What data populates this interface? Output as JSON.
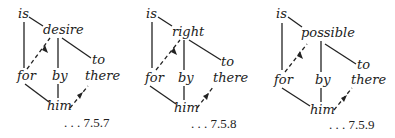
{
  "diagrams": [
    {
      "id": "7.5.7",
      "label": ". . . 7.5.7",
      "nodes": {
        "is": "is",
        "pred": "desire",
        "to": "to",
        "for": "for",
        "by": "by",
        "there": "there",
        "him": "him"
      }
    },
    {
      "id": "7.5.8",
      "label": ". . . 7.5.8",
      "nodes": {
        "is": "is",
        "pred": "right",
        "to": "to",
        "for": "for",
        "by": "by",
        "there": "there",
        "him": "him"
      }
    },
    {
      "id": "7.5.9",
      "label": ". . . 7.5.9",
      "nodes": {
        "is": "is",
        "pred": "possible",
        "to": "to",
        "for": "for",
        "by": "by",
        "there": "there",
        "him": "him"
      }
    }
  ],
  "edges": [
    {
      "from": "is",
      "to": "pred",
      "style": "solid"
    },
    {
      "from": "is",
      "to": "for",
      "style": "solid"
    },
    {
      "from": "pred",
      "to": "by",
      "style": "solid"
    },
    {
      "from": "pred",
      "to": "to",
      "style": "solid"
    },
    {
      "from": "for",
      "to": "pred",
      "style": "dashed-arrow"
    },
    {
      "from": "for",
      "to": "him",
      "style": "solid"
    },
    {
      "from": "by",
      "to": "him",
      "style": "solid"
    },
    {
      "from": "him",
      "to": "there",
      "style": "dashed-arrow"
    }
  ]
}
